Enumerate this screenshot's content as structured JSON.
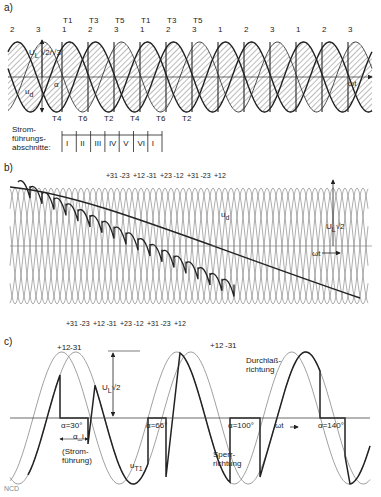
{
  "figure": {
    "panels": [
      {
        "id": "a",
        "label": "a)",
        "phase_labels_top": [
          "2",
          "3",
          "1",
          "2",
          "3",
          "1",
          "2",
          "3",
          "1",
          "2",
          "3",
          "1",
          "2",
          "3"
        ],
        "thyristor_labels_top": [
          "T1",
          "T3",
          "T5",
          "T1",
          "T3",
          "T5"
        ],
        "thyristor_labels_bottom": [
          "T4",
          "T6",
          "T2",
          "T4",
          "T6",
          "T2"
        ],
        "amplitude_label": "U_L·√2/√3",
        "amplitude_num": "U",
        "amplitude_sub": "L",
        "amplitude_frac": "√2/√3",
        "alpha_label": "α",
        "ud_label": "u_d",
        "ud_main": "u",
        "ud_sub": "d",
        "axis_label": "ωt",
        "conduction_caption": [
          "Strom-",
          "führungs-",
          "abschnitte:"
        ],
        "conduction_sections": [
          "I",
          "II",
          "III",
          "IV",
          "V",
          "VI",
          "I"
        ]
      },
      {
        "id": "b",
        "label": "b)",
        "top_labels": [
          "+31",
          "-23",
          "+12",
          "-31",
          "+23",
          "-12",
          "+31",
          "-23",
          "+12"
        ],
        "bottom_labels": [
          "+31",
          "-23",
          "+12",
          "-31",
          "+23",
          "-12",
          "+31",
          "-23",
          "+12"
        ],
        "ud_label": "u_d",
        "ud_main": "u",
        "ud_sub": "d",
        "amplitude_label": "U_L√2",
        "amplitude_main": "U",
        "amplitude_sub": "L",
        "amplitude_root": "√2",
        "axis_label": "ωt"
      },
      {
        "id": "c",
        "label": "c)",
        "top_labels_left": [
          "+12",
          "-31"
        ],
        "top_labels_right": [
          "+12",
          "-31"
        ],
        "amplitude_label": "U_L√2",
        "amplitude_main": "U",
        "amplitude_sub": "L",
        "amplitude_root": "√2",
        "alpha_values": [
          "α=30°",
          "α=66°",
          "α=100°",
          "α=140°"
        ],
        "alpha_i_label": "α_i",
        "conduction_note": [
          "(Strom-",
          "führung)"
        ],
        "forward_direction": [
          "Durchlaß-",
          "richtung"
        ],
        "reverse_direction": [
          "Sperr-",
          "richtung"
        ],
        "uT1_label": "u_T1",
        "uT1_main": "u",
        "uT1_sub": "T1",
        "axis_label": "ωt",
        "corner_mark": "NCD"
      }
    ],
    "colors": {
      "ink": "#222222",
      "thin_curve": "#777777",
      "hatch": "#555555",
      "axis": "#444444"
    }
  }
}
